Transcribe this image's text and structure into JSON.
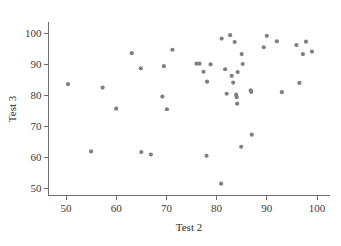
{
  "chart_data": {
    "type": "scatter",
    "title": "",
    "xlabel": "Test 2",
    "ylabel": "Test 3",
    "xlim": [
      46.5,
      102.5
    ],
    "ylim": [
      47.5,
      103.5
    ],
    "xticks": [
      50,
      60,
      70,
      80,
      90,
      100
    ],
    "yticks": [
      50,
      60,
      70,
      80,
      90,
      100
    ],
    "xtick_labels": [
      "50",
      "60",
      "70",
      "80",
      "90",
      "100"
    ],
    "ytick_labels": [
      "50",
      "60",
      "70",
      "80",
      "90",
      "100"
    ],
    "grid": false,
    "legend": null,
    "marker": {
      "shape": "circle",
      "color": "#808080",
      "size_px": 4.2
    },
    "series": [
      {
        "name": "Test 2 vs Test 3",
        "points": [
          [
            50.4,
            83.5
          ],
          [
            55.0,
            61.8
          ],
          [
            57.3,
            82.4
          ],
          [
            60.0,
            75.6
          ],
          [
            63.1,
            93.5
          ],
          [
            64.9,
            88.6
          ],
          [
            65.0,
            61.6
          ],
          [
            66.9,
            60.8
          ],
          [
            69.2,
            79.5
          ],
          [
            69.5,
            89.3
          ],
          [
            70.1,
            75.4
          ],
          [
            71.2,
            94.6
          ],
          [
            76.0,
            90.1
          ],
          [
            76.6,
            90.1
          ],
          [
            77.4,
            87.5
          ],
          [
            78.0,
            60.4
          ],
          [
            78.1,
            84.3
          ],
          [
            78.8,
            89.9
          ],
          [
            80.9,
            51.4
          ],
          [
            81.0,
            98.2
          ],
          [
            81.7,
            88.3
          ],
          [
            82.0,
            80.4
          ],
          [
            82.7,
            99.3
          ],
          [
            83.0,
            86.2
          ],
          [
            83.3,
            84.0
          ],
          [
            83.6,
            97.1
          ],
          [
            83.9,
            80.1
          ],
          [
            84.0,
            79.3
          ],
          [
            84.1,
            77.2
          ],
          [
            84.2,
            87.4
          ],
          [
            84.9,
            63.3
          ],
          [
            85.0,
            93.2
          ],
          [
            85.2,
            90.0
          ],
          [
            86.8,
            81.5
          ],
          [
            86.9,
            81.0
          ],
          [
            87.0,
            67.2
          ],
          [
            89.4,
            95.4
          ],
          [
            90.0,
            99.1
          ],
          [
            92.0,
            97.3
          ],
          [
            93.0,
            80.9
          ],
          [
            95.9,
            96.1
          ],
          [
            96.5,
            83.9
          ],
          [
            97.2,
            93.2
          ],
          [
            97.8,
            97.2
          ],
          [
            99.0,
            94.0
          ]
        ]
      }
    ]
  }
}
